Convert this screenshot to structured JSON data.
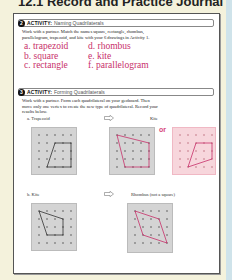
{
  "header": {
    "title": "12.1 Record and Practice Journal"
  },
  "activity2": {
    "number": "2",
    "label": "ACTIVITY:",
    "title": "Naming Quadrilaterals",
    "instructions_line1": "Work with a partner. Match the names square, rectangle, rhombus,",
    "instructions_line2": "parallelogram, trapezoid, and kite with your 6 drawings in Activity 1.",
    "answers": [
      "a. trapezoid",
      "d. rhombus",
      "b. square",
      "e. kite",
      "c. rectangle",
      "f. parallelogram"
    ],
    "answer_color": "#c8306a"
  },
  "activity3": {
    "number": "3",
    "label": "ACTIVITY:",
    "title": "Forming Quadrilaterals",
    "instructions_line1": "Work with a partner. Form each quadrilateral on your geoboard. Then",
    "instructions_line2": "move only one vertex to create the new type of quadrilateral. Record your",
    "instructions_line3": "results below.",
    "part_a": {
      "from": "a. Trapezoid",
      "to": "Kite",
      "or_label": "or"
    },
    "part_b": {
      "from": "b. Kite",
      "to": "Rhombus (not a square)"
    }
  },
  "colors": {
    "background": "#f4f2dc",
    "board": "#d4d4d4",
    "board_pink": "#f7d6dc",
    "accent": "#c8306a"
  }
}
